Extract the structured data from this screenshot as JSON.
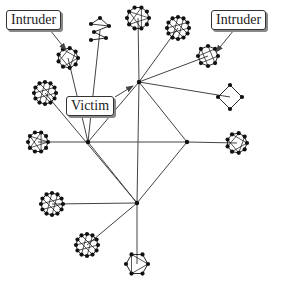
{
  "labels": {
    "intruder_left": "Intruder",
    "intruder_right": "Intruder",
    "victim": "Victim"
  },
  "colors": {
    "edge": "#444444",
    "node": "#111111",
    "background": "#ffffff"
  },
  "hubs": [
    {
      "id": "A",
      "x": 139,
      "y": 82
    },
    {
      "id": "B",
      "x": 88,
      "y": 142
    },
    {
      "id": "C",
      "x": 187,
      "y": 142
    },
    {
      "id": "D",
      "x": 137,
      "y": 203
    }
  ],
  "clusters": [
    {
      "id": "c1",
      "x": 68,
      "y": 58,
      "r": 10,
      "n": 9,
      "hub": "B",
      "type": "ring"
    },
    {
      "id": "c2",
      "x": 100,
      "y": 30,
      "r": 9,
      "n": 6,
      "hub": "B",
      "type": "zigzag"
    },
    {
      "id": "c3",
      "x": 138,
      "y": 18,
      "r": 11,
      "n": 10,
      "hub": "A",
      "type": "ring"
    },
    {
      "id": "c4",
      "x": 178,
      "y": 28,
      "r": 11,
      "n": 12,
      "hub": "A",
      "type": "ring"
    },
    {
      "id": "c5",
      "x": 208,
      "y": 56,
      "r": 10,
      "n": 8,
      "hub": "A",
      "type": "ring"
    },
    {
      "id": "c6",
      "x": 230,
      "y": 97,
      "r": 12,
      "n": 4,
      "hub": "A",
      "type": "diamond"
    },
    {
      "id": "c7",
      "x": 45,
      "y": 93,
      "r": 11,
      "n": 12,
      "hub": "D",
      "type": "ring"
    },
    {
      "id": "c8",
      "x": 38,
      "y": 142,
      "r": 10,
      "n": 10,
      "hub": "B",
      "type": "ring"
    },
    {
      "id": "c9",
      "x": 237,
      "y": 143,
      "r": 10,
      "n": 9,
      "hub": "C",
      "type": "ring"
    },
    {
      "id": "c10",
      "x": 52,
      "y": 204,
      "r": 11,
      "n": 12,
      "hub": "D",
      "type": "ring"
    },
    {
      "id": "c11",
      "x": 87,
      "y": 245,
      "r": 11,
      "n": 12,
      "hub": "D",
      "type": "ring"
    },
    {
      "id": "c12",
      "x": 137,
      "y": 264,
      "r": 11,
      "n": 6,
      "hub": "D",
      "type": "ring"
    }
  ],
  "hub_edges": [
    [
      "A",
      "B"
    ],
    [
      "A",
      "C"
    ],
    [
      "A",
      "D"
    ],
    [
      "B",
      "C"
    ],
    [
      "B",
      "D"
    ],
    [
      "C",
      "D"
    ]
  ],
  "arrows": [
    {
      "from": [
        50,
        30
      ],
      "to": [
        66,
        50
      ],
      "label": "intruder_left"
    },
    {
      "from": [
        234,
        30
      ],
      "to": [
        216,
        52
      ],
      "label": "intruder_right"
    },
    {
      "from": [
        115,
        97
      ],
      "to": [
        133,
        86
      ],
      "label": "victim"
    }
  ]
}
